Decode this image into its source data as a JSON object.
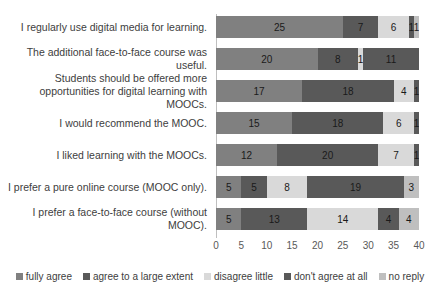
{
  "chart_data": {
    "type": "bar",
    "orientation": "horizontal",
    "stacked": true,
    "title": "",
    "xlabel": "",
    "ylabel": "",
    "xlim": [
      0,
      40
    ],
    "xticks": [
      0,
      5,
      10,
      15,
      20,
      25,
      30,
      35,
      40
    ],
    "grid": false,
    "legend_position": "bottom",
    "categories": [
      "I regularly use digital media for learning.",
      "The additional face-to-face course was useful.",
      "Students should be offered more\nopportunities for digital learning with MOOCs.",
      "I would recommend the MOOC.",
      "I liked learning with the MOOCs.",
      "I prefer a pure online course (MOOC only).",
      "I prefer a face-to-face course (without MOOC)."
    ],
    "series": [
      {
        "name": "fully agree",
        "color": "#808080",
        "values": [
          25,
          20,
          17,
          15,
          12,
          5,
          5
        ]
      },
      {
        "name": "agree to a large extent",
        "color": "#595959",
        "values": [
          7,
          8,
          18,
          18,
          20,
          5,
          13
        ]
      },
      {
        "name": "disagree little",
        "color": "#d9d9d9",
        "values": [
          6,
          1,
          4,
          6,
          7,
          8,
          14
        ]
      },
      {
        "name": "don't agree at all",
        "color": "#595959",
        "values": [
          1,
          11,
          1,
          1,
          1,
          19,
          4
        ]
      },
      {
        "name": "no reply",
        "color": "#bfbfbf",
        "values": [
          1,
          0,
          0,
          0,
          0,
          3,
          4
        ]
      }
    ],
    "bar_totals": [
      40,
      40,
      40,
      40,
      40,
      40,
      40
    ]
  },
  "legend": {
    "items": [
      {
        "label": "fully agree",
        "color": "#808080"
      },
      {
        "label": "agree to a large extent",
        "color": "#595959"
      },
      {
        "label": "disagree little",
        "color": "#d9d9d9"
      },
      {
        "label": "don't agree at all",
        "color": "#595959"
      },
      {
        "label": "no reply",
        "color": "#bfbfbf"
      }
    ]
  }
}
